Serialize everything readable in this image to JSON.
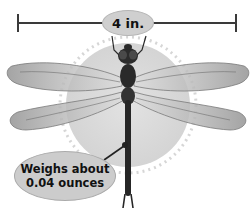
{
  "figure": {
    "length_label": "4 in.",
    "weight_callout": {
      "line1": "Weighs about",
      "line2": "0.04 ounces"
    },
    "colors": {
      "ruler": "#3a3a3a",
      "label_fill": "#cfcfcf",
      "halo": "#d9d9d9",
      "body": "#2a2a2a",
      "wing": "#b8b8b8"
    }
  }
}
